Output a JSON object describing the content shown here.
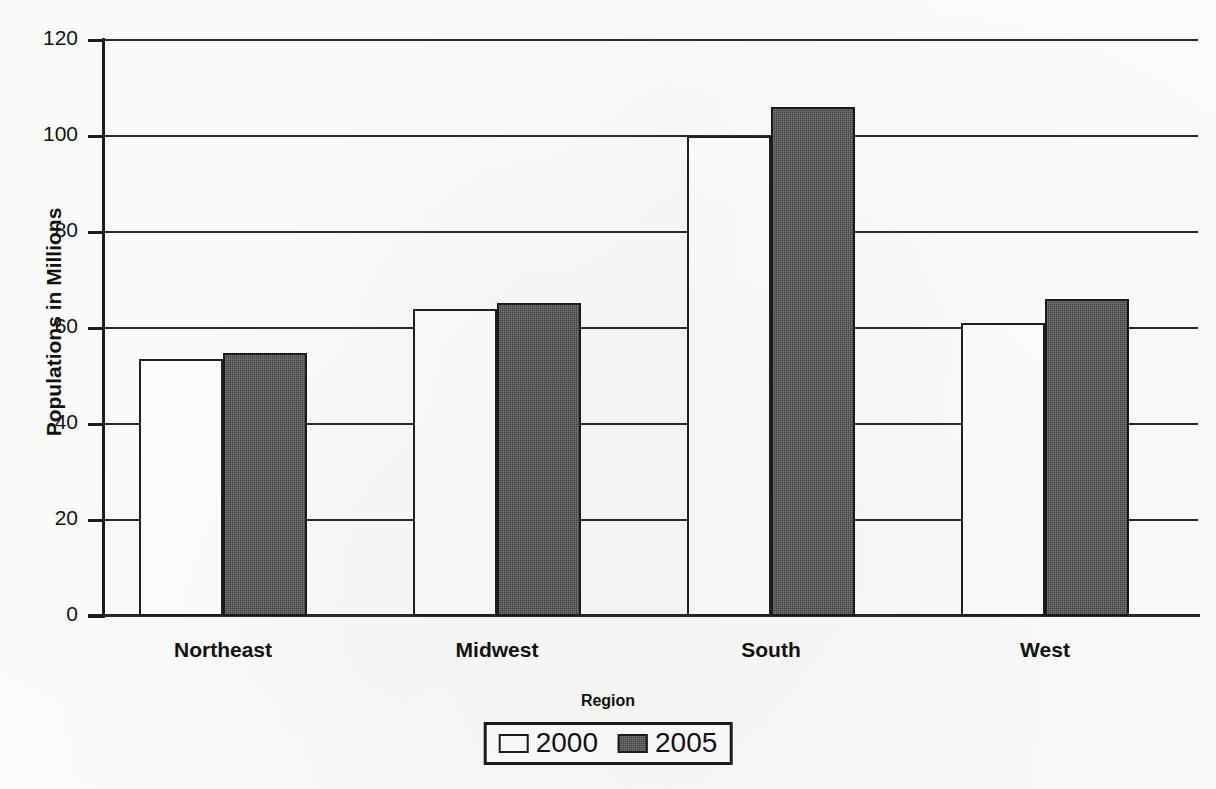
{
  "chart_data": {
    "type": "bar",
    "title": "",
    "xlabel": "Region",
    "ylabel": "Populations in Millions",
    "categories": [
      "Northeast",
      "Midwest",
      "South",
      "West"
    ],
    "series": [
      {
        "name": "2000",
        "values": [
          53.6,
          64.0,
          100.0,
          61.0
        ],
        "color": "#ffffff"
      },
      {
        "name": "2005",
        "values": [
          54.8,
          65.3,
          106.0,
          66.0
        ],
        "color": "#575757"
      }
    ],
    "ylim": [
      0,
      120
    ],
    "y_ticks": [
      0,
      20,
      40,
      60,
      80,
      100,
      120
    ],
    "y_tick_labels": [
      "0",
      "20",
      "40",
      "60",
      "80",
      "100",
      "120"
    ],
    "grid": true,
    "legend_position": "bottom"
  },
  "legend": {
    "entries": [
      {
        "label": "2000",
        "swatch": "legend-swatch-2000"
      },
      {
        "label": "2005",
        "swatch": "legend-swatch-2005"
      }
    ]
  },
  "colors": {
    "series_2000": "#ffffff",
    "series_2005": "#575757",
    "axis": "#1a1a1a",
    "grid": "#2a2a2a",
    "background": "#fdfdfc"
  }
}
